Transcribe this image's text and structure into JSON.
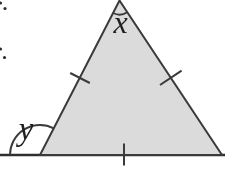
{
  "figure": {
    "type": "geometry-diagram",
    "labels": {
      "apex_angle": "x",
      "exterior_angle": "y"
    },
    "marks": {
      "equal_side_tick_count": 3,
      "angle_arc_count": 2,
      "left_edge_stray_dot_count": 4
    },
    "colors": {
      "background": "#ffffff",
      "triangle_fill": "#dbdbdb",
      "line": "#3a3a3a",
      "label_text": "#1f1f1f"
    }
  }
}
